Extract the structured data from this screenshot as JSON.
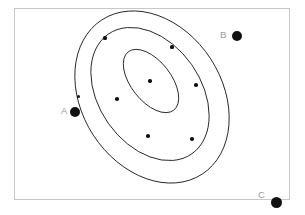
{
  "figure": {
    "frame": {
      "x": 14,
      "y": 8,
      "width": 276,
      "height": 192,
      "border_color": "#c8c8c8"
    },
    "background": "#ffffff",
    "ink_color": "#111111",
    "label_color": "#9a9a9a"
  },
  "chart_data": {
    "type": "scatter",
    "title": "",
    "subtitle": "",
    "xlabel": "",
    "ylabel": "",
    "grid": false,
    "legend": "none",
    "axis_ticks": false,
    "xlim": [
      0,
      305
    ],
    "ylim": [
      0,
      215
    ],
    "points": [
      {
        "name": "p1",
        "x": 105,
        "y": 38,
        "r": 1.6
      },
      {
        "name": "p2",
        "x": 172,
        "y": 47,
        "r": 1.6
      },
      {
        "name": "p3",
        "x": 150,
        "y": 81,
        "r": 1.8
      },
      {
        "name": "p4",
        "x": 117,
        "y": 99,
        "r": 1.8
      },
      {
        "name": "p5",
        "x": 78,
        "y": 96,
        "r": 1.5
      },
      {
        "name": "p6",
        "x": 196,
        "y": 85,
        "r": 1.8
      },
      {
        "name": "p7",
        "x": 148,
        "y": 136,
        "r": 1.8
      },
      {
        "name": "p8",
        "x": 192,
        "y": 139,
        "r": 1.8
      }
    ],
    "contours": [
      {
        "name": "outer-contour",
        "level": 1,
        "cx": 152,
        "cy": 97,
        "rx": 70,
        "ry": 92,
        "rotation_deg": -33
      },
      {
        "name": "middle-contour",
        "level": 2,
        "cx": 150,
        "cy": 94,
        "rx": 51,
        "ry": 73,
        "rotation_deg": -35
      },
      {
        "name": "inner-contour",
        "level": 3,
        "cx": 151,
        "cy": 81,
        "rx": 20,
        "ry": 37,
        "rotation_deg": -38
      }
    ],
    "markers": [
      {
        "label": "A",
        "label_x": 61,
        "label_y": 106,
        "dot_x": 75,
        "dot_y": 112,
        "dot_r": 5.0
      },
      {
        "label": "B",
        "label_x": 220,
        "label_y": 30,
        "dot_x": 237,
        "dot_y": 36,
        "dot_r": 5.0
      },
      {
        "label": "C",
        "label_x": 258,
        "label_y": 190,
        "dot_x": 276,
        "dot_y": 202,
        "dot_r": 5.5
      }
    ]
  }
}
